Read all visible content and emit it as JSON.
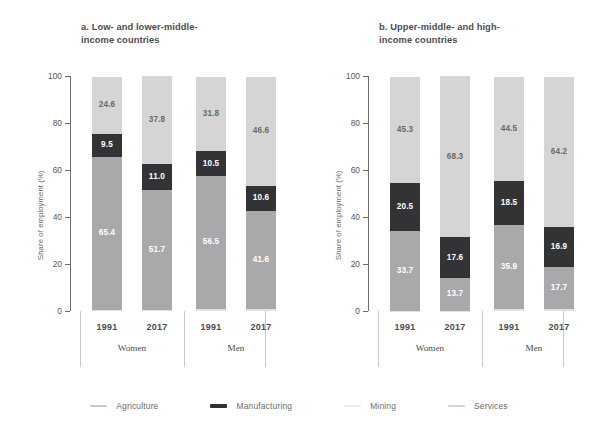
{
  "chart_data": {
    "type": "bar",
    "title": "",
    "subtype": "stacked-bar-100pct",
    "ylabel": "Share of employment (%)",
    "xlabel": "",
    "ylim": [
      0,
      100
    ],
    "yticks": [
      "0",
      "20",
      "40",
      "60",
      "80",
      "100"
    ],
    "grid": false,
    "legend_position": "bottom",
    "categories": [
      "1991",
      "2017",
      "1991",
      "2017"
    ],
    "groups": [
      "Women",
      "Men"
    ],
    "series": [
      {
        "name": "Agriculture",
        "color": "#e2e2e2",
        "panel_a": [
          0.3,
          0.3,
          0.9,
          1.0
        ],
        "panel_b": [
          0.2,
          0.2,
          0.9,
          1.0
        ]
      },
      {
        "name": "Mining",
        "color": "#a9a9ac",
        "panel_a": [
          65.4,
          51.7,
          56.5,
          41.6
        ],
        "panel_b": [
          33.7,
          13.7,
          35.9,
          17.7
        ]
      },
      {
        "name": "Manufacturing",
        "color": "#333335",
        "panel_a": [
          9.5,
          11.0,
          10.5,
          10.6
        ],
        "panel_b": [
          20.5,
          17.6,
          18.5,
          16.9
        ]
      },
      {
        "name": "Services",
        "color": "#d5d5d5",
        "panel_a": [
          24.6,
          37.8,
          31.8,
          46.6
        ],
        "panel_b": [
          45.3,
          68.3,
          44.5,
          64.2
        ]
      }
    ],
    "panels": [
      {
        "id": "a",
        "title": "a.  Low- and lower-middle-\nincome countries",
        "bars": [
          {
            "year": "1991",
            "group": "Women",
            "segments": [
              {
                "name": "Agriculture",
                "value": 0.3,
                "label": "0.3"
              },
              {
                "name": "Mining",
                "value": 65.4,
                "label": "65.4"
              },
              {
                "name": "Manufacturing",
                "value": 9.5,
                "label": "9.5"
              },
              {
                "name": "Services",
                "value": 24.6,
                "label": "24.6"
              }
            ]
          },
          {
            "year": "2017",
            "group": "Women",
            "segments": [
              {
                "name": "Agriculture",
                "value": 0.3,
                "label": "0.3"
              },
              {
                "name": "Mining",
                "value": 51.7,
                "label": "51.7"
              },
              {
                "name": "Manufacturing",
                "value": 11.0,
                "label": "11.0"
              },
              {
                "name": "Services",
                "value": 37.8,
                "label": "37.8"
              }
            ]
          },
          {
            "year": "1991",
            "group": "Men",
            "segments": [
              {
                "name": "Agriculture",
                "value": 0.9,
                "label": "0.9"
              },
              {
                "name": "Mining",
                "value": 56.5,
                "label": "56.5"
              },
              {
                "name": "Manufacturing",
                "value": 10.5,
                "label": "10.5"
              },
              {
                "name": "Services",
                "value": 31.8,
                "label": "31.8"
              }
            ]
          },
          {
            "year": "2017",
            "group": "Men",
            "segments": [
              {
                "name": "Agriculture",
                "value": 1.0,
                "label": "1.0"
              },
              {
                "name": "Mining",
                "value": 41.6,
                "label": "41.6"
              },
              {
                "name": "Manufacturing",
                "value": 10.6,
                "label": "10.6"
              },
              {
                "name": "Services",
                "value": 46.6,
                "label": "46.6"
              }
            ]
          }
        ]
      },
      {
        "id": "b",
        "title": "b. Upper-middle- and high-\nincome countries",
        "bars": [
          {
            "year": "1991",
            "group": "Women",
            "segments": [
              {
                "name": "Agriculture",
                "value": 0.2,
                "label": "0.2"
              },
              {
                "name": "Mining",
                "value": 33.7,
                "label": "33.7"
              },
              {
                "name": "Manufacturing",
                "value": 20.5,
                "label": "20.5"
              },
              {
                "name": "Services",
                "value": 45.3,
                "label": "45.3"
              }
            ]
          },
          {
            "year": "2017",
            "group": "Women",
            "segments": [
              {
                "name": "Agriculture",
                "value": 0.2,
                "label": "0.2"
              },
              {
                "name": "Mining",
                "value": 13.7,
                "label": "13.7"
              },
              {
                "name": "Manufacturing",
                "value": 17.6,
                "label": "17.6"
              },
              {
                "name": "Services",
                "value": 68.3,
                "label": "68.3"
              }
            ]
          },
          {
            "year": "1991",
            "group": "Men",
            "segments": [
              {
                "name": "Agriculture",
                "value": 0.9,
                "label": "0.9"
              },
              {
                "name": "Mining",
                "value": 35.9,
                "label": "35.9"
              },
              {
                "name": "Manufacturing",
                "value": 18.5,
                "label": "18.5"
              },
              {
                "name": "Services",
                "value": 44.5,
                "label": "44.5"
              }
            ]
          },
          {
            "year": "2017",
            "group": "Men",
            "segments": [
              {
                "name": "Agriculture",
                "value": 1.0,
                "label": "1.0"
              },
              {
                "name": "Mining",
                "value": 17.7,
                "label": "17.7"
              },
              {
                "name": "Manufacturing",
                "value": 16.9,
                "label": "16.9"
              },
              {
                "name": "Services",
                "value": 64.2,
                "label": "64.2"
              }
            ]
          }
        ]
      }
    ],
    "legend": [
      {
        "label": "Agriculture",
        "color": "#c9c9c9"
      },
      {
        "label": "Manufacturing",
        "color": "#333335"
      },
      {
        "label": "Mining",
        "color": "#ededed"
      },
      {
        "label": "Services",
        "color": "#d5d5d5"
      }
    ]
  }
}
